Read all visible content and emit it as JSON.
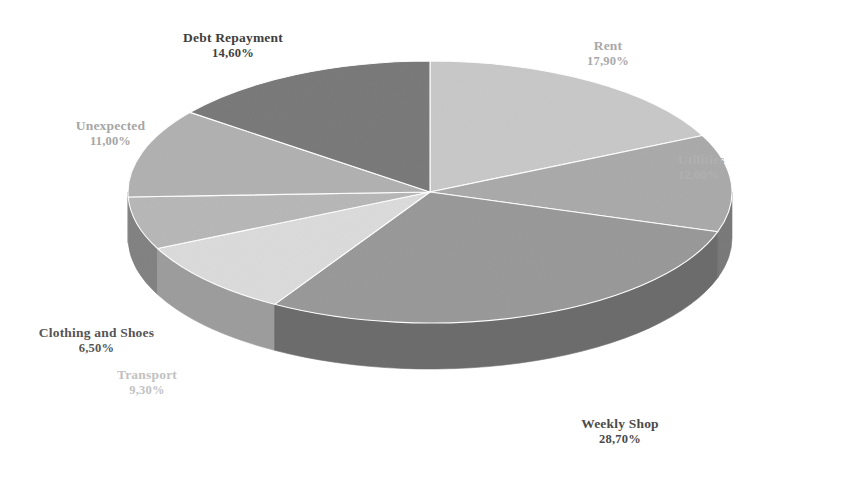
{
  "chart_data": {
    "type": "pie",
    "title": "",
    "subtitle": "",
    "xlabel": "",
    "ylabel": "",
    "legend_position": "none",
    "grid": false,
    "style": "3d-exploded-none",
    "value_suffix": "%",
    "decimal_separator": ",",
    "categories": [
      "Rent",
      "Utilities",
      "Weekly Shop",
      "Transport",
      "Clothing and Shoes",
      "Unexpected",
      "Debt Repayment"
    ],
    "values": [
      17.9,
      12.0,
      28.7,
      9.3,
      6.5,
      11.0,
      14.6
    ],
    "value_labels": [
      "17,90%",
      "12,00%",
      "28,70%",
      "9,30%",
      "6,50%",
      "11,00%",
      "14,60%"
    ],
    "colors": [
      "#c9c9c9",
      "#ababab",
      "#9a9a9a",
      "#dcdcdc",
      "#b8b8b8",
      "#b2b2b2",
      "#7b7b7b"
    ],
    "side_colors": [
      "#8f8f8f",
      "#7b7b7b",
      "#6d6d6d",
      "#9e9e9e",
      "#838383",
      "#808080",
      "#585858"
    ],
    "slices": [
      {
        "label": "Rent",
        "value": 17.9,
        "value_label": "17,90%",
        "color": "#c9c9c9",
        "side_color": "#8f8f8f"
      },
      {
        "label": "Utilities",
        "value": 12.0,
        "value_label": "12,00%",
        "color": "#ababab",
        "side_color": "#7b7b7b"
      },
      {
        "label": "Weekly Shop",
        "value": 28.7,
        "value_label": "28,70%",
        "color": "#9a9a9a",
        "side_color": "#6d6d6d"
      },
      {
        "label": "Transport",
        "value": 9.3,
        "value_label": "9,30%",
        "color": "#dcdcdc",
        "side_color": "#9e9e9e"
      },
      {
        "label": "Clothing and Shoes",
        "value": 6.5,
        "value_label": "6,50%",
        "color": "#b8b8b8",
        "side_color": "#838383"
      },
      {
        "label": "Unexpected",
        "value": 11.0,
        "value_label": "11,00%",
        "color": "#b2b2b2",
        "side_color": "#808080"
      },
      {
        "label": "Debt Repayment",
        "value": 14.6,
        "value_label": "14,60%",
        "color": "#7b7b7b",
        "side_color": "#585858"
      }
    ],
    "total": 100.0,
    "background": "#ffffff"
  },
  "labels": {
    "rent": {
      "name": "Rent",
      "value": "17,90%"
    },
    "utilities": {
      "name": "Utilities",
      "value": "12,00%"
    },
    "weekly": {
      "name": "Weekly Shop",
      "value": "28,70%"
    },
    "transport": {
      "name": "Transport",
      "value": "9,30%"
    },
    "clothing": {
      "name": "Clothing and Shoes",
      "value": "6,50%"
    },
    "unexpected": {
      "name": "Unexpected",
      "value": "11,00%"
    },
    "debt": {
      "name": "Debt Repayment",
      "value": "14,60%"
    }
  }
}
